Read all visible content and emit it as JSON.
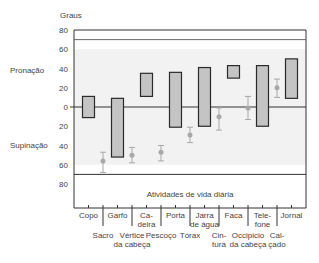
{
  "chart_data": {
    "type": "range-bar",
    "title": "",
    "ylabel": "Graus",
    "ylabel_upper": "Pronação",
    "ylabel_lower": "Supinação",
    "y_ticks": [
      80,
      60,
      40,
      20,
      0,
      20,
      40,
      60,
      80
    ],
    "y_tick_values": [
      80,
      60,
      40,
      20,
      0,
      -20,
      -40,
      -60,
      -80
    ],
    "ylim": [
      -80,
      80
    ],
    "band_label": "Atividades de vida diária",
    "categories": [
      "Copo",
      "Garfo",
      "Ca-\ndeira",
      "Porta",
      "Jarra\nde água",
      "Faca",
      "Tele-\nfone",
      "Jornal"
    ],
    "range_series": {
      "name": "Atividades de vida diária",
      "ranges": [
        {
          "label": "Copo",
          "low": -11,
          "high": 11
        },
        {
          "label": "Garfo",
          "low": -52,
          "high": 9
        },
        {
          "label": "Cadeira",
          "low": 11,
          "high": 35
        },
        {
          "label": "Porta",
          "low": -21,
          "high": 36
        },
        {
          "label": "Jarra de água",
          "low": -20,
          "high": 41
        },
        {
          "label": "Faca",
          "low": 30,
          "high": 43
        },
        {
          "label": "Telefone",
          "low": -20,
          "high": 43
        },
        {
          "label": "Jornal",
          "low": 9,
          "high": 50
        }
      ]
    },
    "point_series": {
      "name": "Tarefas de higiene/vestuário",
      "points": [
        {
          "label": "Sacro",
          "value": -56,
          "low": -68,
          "high": -47
        },
        {
          "label": "Vértice da cabeça",
          "value": -50,
          "low": -58,
          "high": -42
        },
        {
          "label": "Pescoço",
          "value": -47,
          "low": -56,
          "high": -40
        },
        {
          "label": "Tórax",
          "value": -29,
          "low": -37,
          "high": -21
        },
        {
          "label": "Cintura",
          "value": -10,
          "low": -24,
          "high": -1
        },
        {
          "label": "Occipício da cabeça",
          "value": -1,
          "low": -13,
          "high": 11
        },
        {
          "label": "Calçado",
          "value": 20,
          "low": 10,
          "high": 29
        }
      ]
    },
    "bottom_labels": [
      {
        "line1": "Sacro",
        "line2": ""
      },
      {
        "line1": "Vértice",
        "line2": "da cabeça"
      },
      {
        "line1": "Pescoço",
        "line2": ""
      },
      {
        "line1": "Tórax",
        "line2": ""
      },
      {
        "line1": "Cin-",
        "line2": "tura"
      },
      {
        "line1": "Occipicio",
        "line2": "da cabeça"
      },
      {
        "line1": "Cal-",
        "line2": "çado"
      }
    ],
    "grid": false,
    "colors": {
      "bar_fill": "#c4c4c4",
      "bar_stroke": "#2a2a2a",
      "point": "#a8a8a8",
      "band": "#f2f2f2",
      "axis": "#333333"
    }
  }
}
